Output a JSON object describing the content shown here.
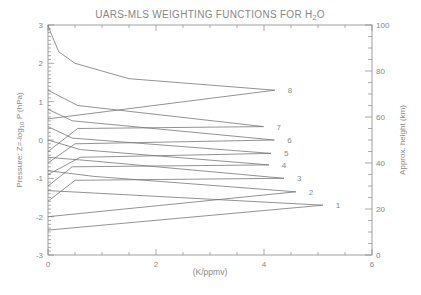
{
  "chart_data": {
    "type": "line",
    "title": "UARS-MLS WEIGHTING FUNCTIONS FOR H",
    "title_subscript": "2",
    "title_suffix": "O",
    "xlabel": "(K/ppmv)",
    "ylabel_left": "Pressure: Z=-log",
    "ylabel_left_sub": "10",
    "ylabel_left_suffix": " P (hPa)",
    "ylabel_right": "Approx. height (km)",
    "xlim": [
      0,
      6
    ],
    "ylim": [
      -3,
      3
    ],
    "y2lim": [
      0,
      100
    ],
    "x_ticks": [
      "0",
      "2",
      "4",
      "6"
    ],
    "x_tick_values": [
      0,
      2,
      4,
      6
    ],
    "y_ticks": [
      "-3",
      "-2",
      "-1",
      "0",
      "1",
      "2",
      "3"
    ],
    "y_tick_values": [
      -3,
      -2,
      -1,
      0,
      1,
      2,
      3
    ],
    "y2_ticks": [
      "0",
      "20",
      "40",
      "60",
      "80",
      "100"
    ],
    "y2_tick_values": [
      0,
      20,
      40,
      60,
      80,
      100
    ],
    "grid": false,
    "series": [
      {
        "name": "1",
        "label": "1",
        "points": [
          [
            0,
            -2.35
          ],
          [
            5.09,
            -1.7
          ],
          [
            0,
            -1.32
          ]
        ]
      },
      {
        "name": "2",
        "label": "2",
        "points": [
          [
            0,
            -2.0
          ],
          [
            4.59,
            -1.35
          ],
          [
            0.85,
            -0.95
          ],
          [
            0,
            -0.8
          ]
        ]
      },
      {
        "name": "3",
        "label": "3",
        "points": [
          [
            0,
            -1.6
          ],
          [
            0.5,
            -1.05
          ],
          [
            4.37,
            -1.0
          ],
          [
            0.85,
            -0.55
          ],
          [
            0,
            -0.45
          ]
        ]
      },
      {
        "name": "4",
        "label": "4",
        "points": [
          [
            0,
            -1.2
          ],
          [
            0.45,
            -0.7
          ],
          [
            4.09,
            -0.65
          ],
          [
            0.6,
            -0.25
          ],
          [
            0,
            0.0
          ]
        ]
      },
      {
        "name": "5",
        "label": "5",
        "points": [
          [
            0,
            -0.9
          ],
          [
            0.6,
            -0.45
          ],
          [
            4.13,
            -0.35
          ],
          [
            0.45,
            0.05
          ],
          [
            0,
            0.35
          ]
        ]
      },
      {
        "name": "6",
        "label": "6",
        "points": [
          [
            0,
            -0.6
          ],
          [
            0.5,
            -0.1
          ],
          [
            4.19,
            0.0
          ],
          [
            0.45,
            0.5
          ],
          [
            0,
            0.8
          ]
        ]
      },
      {
        "name": "7",
        "label": "7",
        "points": [
          [
            0,
            -0.3
          ],
          [
            0.55,
            0.3
          ],
          [
            3.99,
            0.35
          ],
          [
            0.55,
            0.9
          ],
          [
            0,
            1.3
          ]
        ]
      },
      {
        "name": "8",
        "label": "8",
        "points": [
          [
            0,
            0.55
          ],
          [
            4.2,
            1.3
          ],
          [
            1.5,
            1.6
          ],
          [
            0.5,
            2.0
          ],
          [
            0.2,
            2.3
          ],
          [
            0.05,
            2.8
          ],
          [
            0,
            3.0
          ]
        ]
      }
    ]
  }
}
